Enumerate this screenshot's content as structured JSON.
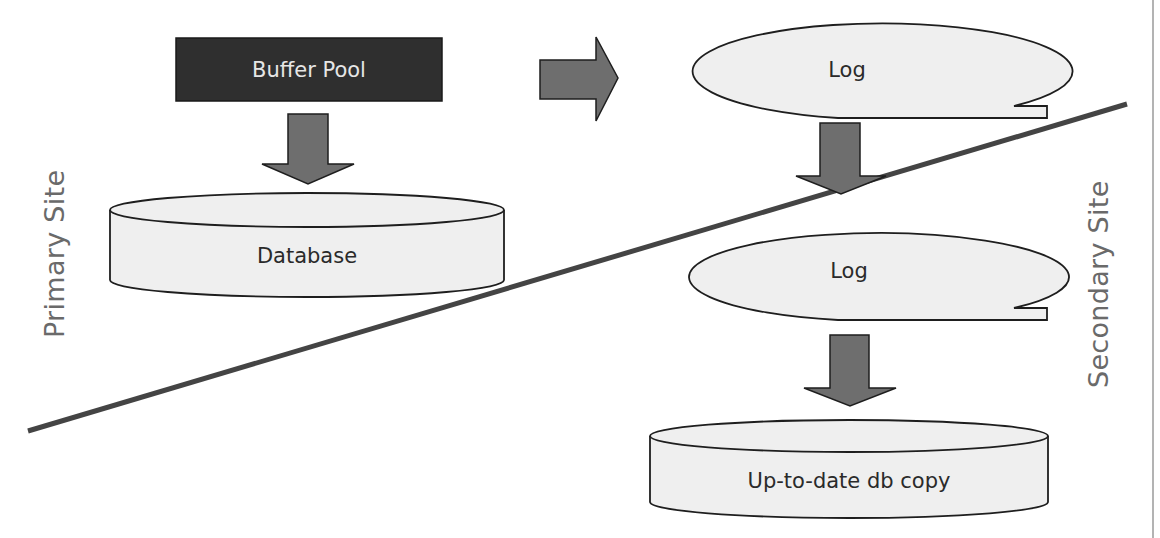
{
  "diagram": {
    "colors": {
      "background": "#ffffff",
      "buffer_pool_fill": "#2f2f2f",
      "shape_fill": "#efefef",
      "arrow_fill": "#6e6e6e",
      "outline": "#1e1e1e",
      "divider": "#444444",
      "side_label": "#6a6a6a"
    },
    "primary": {
      "side_label": "Primary Site",
      "buffer_pool": "Buffer Pool",
      "database": "Database",
      "log": "Log"
    },
    "secondary": {
      "side_label": "Secondary Site",
      "log": "Log",
      "db_copy": "Up-to-date db copy"
    },
    "arrows": [
      {
        "name": "buffer-pool-to-database",
        "direction": "down"
      },
      {
        "name": "buffer-pool-to-log",
        "direction": "right"
      },
      {
        "name": "primary-log-to-secondary-log",
        "direction": "down"
      },
      {
        "name": "secondary-log-to-db-copy",
        "direction": "down"
      }
    ]
  }
}
